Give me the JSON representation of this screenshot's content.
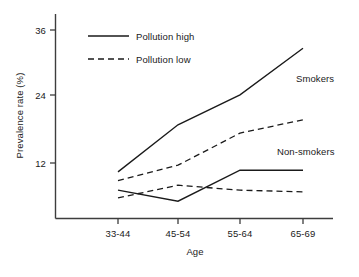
{
  "chart_data": {
    "type": "line",
    "title": "",
    "subtitle": "",
    "xlabel": "Age",
    "ylabel": "Prevalence rate (%)",
    "categories": [
      "33-44",
      "45-54",
      "55-64",
      "65-69"
    ],
    "yticks": [
      12,
      24,
      36
    ],
    "ylim": [
      0,
      38
    ],
    "grid": false,
    "legend": {
      "position": "upper-left-inside",
      "entries": [
        {
          "name": "Pollution high",
          "style": "solid"
        },
        {
          "name": "Pollution low",
          "style": "dashed"
        }
      ]
    },
    "annotations": [
      {
        "text": "Smokers",
        "x": "65-69",
        "y": 28
      },
      {
        "text": "Non-smokers",
        "x": "65-69",
        "y": 14
      }
    ],
    "series": [
      {
        "name": "Smokers, pollution high",
        "group": "Smokers",
        "style": "solid",
        "values": [
          10.4,
          18.9,
          24.3,
          32.7
        ]
      },
      {
        "name": "Smokers, pollution low",
        "group": "Smokers",
        "style": "dashed",
        "values": [
          8.8,
          11.6,
          17.4,
          19.8
        ]
      },
      {
        "name": "Non-smokers, pollution high",
        "group": "Non-smokers",
        "style": "solid",
        "values": [
          7.1,
          5.1,
          10.7,
          10.7
        ]
      },
      {
        "name": "Non-smokers, pollution low",
        "group": "Non-smokers",
        "style": "dashed",
        "values": [
          5.7,
          8.0,
          7.1,
          6.8
        ]
      }
    ]
  },
  "axis": {
    "ytick_labels": [
      "36",
      "24",
      "12"
    ],
    "xtick_labels": [
      "33-44",
      "45-54",
      "55-64",
      "65-69"
    ],
    "ylabel": "Prevalence rate (%)",
    "xlabel": "Age"
  },
  "legend": {
    "high_label": "Pollution high",
    "low_label": "Pollution low"
  },
  "annotations": {
    "smokers": "Smokers",
    "non_smokers": "Non-smokers"
  },
  "colors": {
    "line": "#1a1a1a",
    "axis": "#444444",
    "background": "#ffffff"
  }
}
